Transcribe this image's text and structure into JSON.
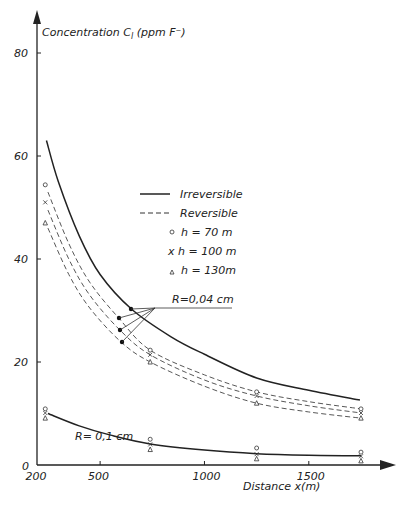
{
  "chart_data": {
    "type": "line",
    "title": "",
    "xlabel": "Distance x(m)",
    "ylabel": "Concentration C_l (ppm F⁻)",
    "xlim": [
      200,
      1900
    ],
    "ylim": [
      0,
      85
    ],
    "x_ticks": [
      200,
      500,
      1000,
      1500
    ],
    "y_ticks": [
      0,
      20,
      40,
      60,
      80
    ],
    "grid": false,
    "legend": {
      "position": "center-right",
      "entries": [
        {
          "label": "Irreversible",
          "style": "solid-line"
        },
        {
          "label": "Reversible",
          "style": "dashed-line"
        },
        {
          "label": "h = 70 m",
          "style": "circle-marker"
        },
        {
          "label": "h = 100 m",
          "style": "x-marker"
        },
        {
          "label": "h = 130 m",
          "style": "triangle-marker"
        }
      ]
    },
    "annotations": [
      {
        "text": "R=0,04 cm",
        "applies_to": "upper curve group"
      },
      {
        "text": "R= 0,1 cm",
        "applies_to": "lower curve group"
      }
    ],
    "series": [
      {
        "name": "Irreversible, R=0.04 cm",
        "style": "solid",
        "x": [
          243,
          300,
          400,
          500,
          650,
          840,
          1000,
          1250,
          1500,
          1745
        ],
        "y": [
          63,
          55,
          44.5,
          37,
          30.3,
          24.9,
          21.5,
          16.9,
          14.5,
          12.6
        ]
      },
      {
        "name": "Reversible h=70 m, R=0.04 cm",
        "style": "dashed",
        "x": [
          250,
          350,
          450,
          590,
          740,
          1000,
          1250,
          1500,
          1750
        ],
        "y": [
          53,
          43,
          35.5,
          28.5,
          22.3,
          17.5,
          14.2,
          12.3,
          10.9
        ]
      },
      {
        "name": "Reversible h=100 m, R=0.04 cm",
        "style": "dashed",
        "x": [
          250,
          350,
          450,
          595,
          740,
          1000,
          1250,
          1500,
          1750
        ],
        "y": [
          49.5,
          40,
          33,
          26.2,
          21.4,
          16.5,
          13.4,
          11.5,
          10.1
        ]
      },
      {
        "name": "Reversible h=130 m, R=0.04 cm",
        "style": "dashed",
        "x": [
          250,
          350,
          450,
          600,
          740,
          1000,
          1250,
          1500,
          1750
        ],
        "y": [
          46,
          37,
          30.5,
          23.9,
          20,
          15.3,
          12,
          10.3,
          9.1
        ]
      },
      {
        "name": "Irreversible, R=0.1 cm",
        "style": "solid",
        "x": [
          250,
          400,
          550,
          740,
          1000,
          1250,
          1500,
          1750
        ],
        "y": [
          10,
          7.6,
          5.8,
          4.1,
          2.9,
          2.2,
          1.9,
          1.8
        ]
      }
    ],
    "markers": {
      "h_70m_circle": {
        "x": [
          230,
          740,
          1250,
          1750,
          230,
          740,
          1250,
          1750
        ],
        "y": [
          54.4,
          22.3,
          14.2,
          10.9,
          10.9,
          5.0,
          3.3,
          2.5
        ]
      },
      "h_100m_x": {
        "x": [
          230,
          740,
          1250,
          1750,
          230,
          740,
          1250,
          1750
        ],
        "y": [
          51,
          21.4,
          13.4,
          10.1,
          10.1,
          4.0,
          2.1,
          1.7
        ]
      },
      "h_130m_triangle": {
        "x": [
          230,
          740,
          1250,
          1750,
          230,
          740,
          1250,
          1750
        ],
        "y": [
          47,
          20,
          12,
          9.1,
          9.1,
          3.0,
          1.2,
          0.8
        ]
      },
      "R_004_filled_dots": {
        "x": [
          650,
          590,
          595,
          600
        ],
        "y": [
          30.3,
          28.5,
          26.2,
          23.9
        ]
      }
    }
  },
  "labels": {
    "ylabel": "Concentration C",
    "ylabel_sub": "l",
    "ylabel_unit": " (ppm F⁻)",
    "xlabel": "Distance x(m)",
    "origin": "0",
    "note_r004": "R=0,04 cm",
    "note_r01": "R= 0,1 cm",
    "legend_irreversible": "Irreversible",
    "legend_reversible": "Reversible",
    "legend_h70": "h = 70 m",
    "legend_h100": "x  h = 100 m",
    "legend_h130": "h = 130m"
  }
}
